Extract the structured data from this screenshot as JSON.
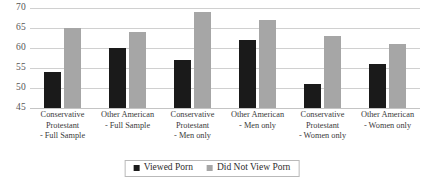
{
  "chart_data": {
    "type": "bar",
    "title": "",
    "subtitle": "",
    "xlabel": "",
    "ylabel": "",
    "ylim": [
      45,
      70
    ],
    "ytick_values": [
      70,
      65,
      60,
      55,
      50,
      45
    ],
    "ytick_labels": [
      "70",
      "65",
      "60",
      "55",
      "50",
      "45"
    ],
    "grid": true,
    "legend_position": "bottom-center",
    "categories": [
      "Conservative Protestant - Full Sample",
      "Other American - Full Sample",
      "Conservative Protestant - Men only",
      "Other American - Men only",
      "Conservative Protestant - Women only",
      "Other American - Women only"
    ],
    "category_lines": [
      [
        "Conservative",
        "Protestant",
        "- Full Sample"
      ],
      [
        "Other American",
        "- Full Sample"
      ],
      [
        "Conservative",
        "Protestant",
        "- Men only"
      ],
      [
        "Other American",
        "- Men only"
      ],
      [
        "Conservative",
        "Protestant",
        "- Women only"
      ],
      [
        "Other American",
        "- Women only"
      ]
    ],
    "series": [
      {
        "name": "Viewed Porn",
        "color": "#1a1a1a",
        "values": [
          54,
          60,
          57,
          62,
          51,
          56
        ]
      },
      {
        "name": "Did Not View Porn",
        "color": "#a6a6a6",
        "values": [
          65,
          64,
          69,
          67,
          63,
          61
        ]
      }
    ]
  },
  "legend": {
    "items": [
      {
        "label": "Viewed Porn",
        "color": "#1a1a1a"
      },
      {
        "label": "Did Not View Porn",
        "color": "#a6a6a6"
      }
    ]
  },
  "colors": {
    "series_viewed": "#1a1a1a",
    "series_not_viewed": "#a6a6a6",
    "gridline": "#d0d0d0",
    "text": "#3a3a3a",
    "background": "#ffffff"
  }
}
